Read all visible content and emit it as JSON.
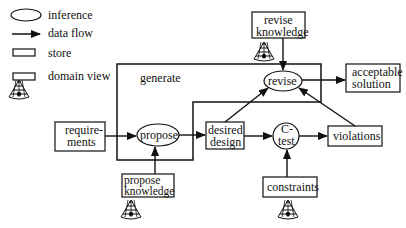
{
  "legend": {
    "items": [
      {
        "symbol": "ellipse",
        "label": "inference"
      },
      {
        "symbol": "arrow",
        "label": "data flow"
      },
      {
        "symbol": "rectangle",
        "label": "store"
      },
      {
        "symbol": "rectangle-with-cone",
        "label": "domain view"
      }
    ]
  },
  "diagram": {
    "region_label": "generate",
    "inferences": {
      "propose": "propose",
      "revise": "revise",
      "ctest_line1": "C-",
      "ctest_line2": "test"
    },
    "stores": {
      "requirements_line1": "require-",
      "requirements_line2": "ments",
      "desired_design_line1": "desired",
      "desired_design_line2": "design",
      "violations": "violations",
      "acceptable_solution_line1": "acceptable",
      "acceptable_solution_line2": "solution"
    },
    "domain_views": {
      "revise_knowledge_line1": "revise",
      "revise_knowledge_line2": "knowledge",
      "propose_knowledge_line1": "propose",
      "propose_knowledge_line2": "knowledge",
      "constraints": "constraints"
    },
    "colors": {
      "stroke": "#111111",
      "background": "#ffffff"
    }
  }
}
